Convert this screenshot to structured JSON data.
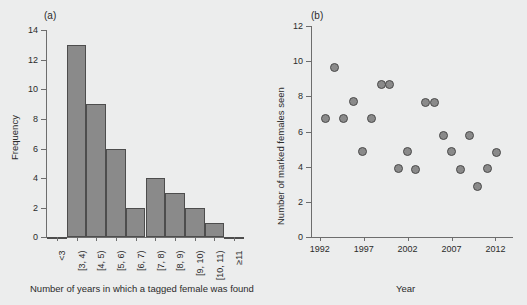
{
  "figure": {
    "background": "#eceded",
    "fill_color": "#8a8a8a",
    "stroke_color": "#4d4d4d",
    "axis_color": "#6d6d6d"
  },
  "panel_a": {
    "label": "(a)",
    "ylabel": "Frequency",
    "xlabel": "Number of years in which a tagged female was found"
  },
  "panel_b": {
    "label": "(b)",
    "ylabel": "Number of marked females seen",
    "xlabel": "Year"
  },
  "chart_data": [
    {
      "type": "bar",
      "panel": "(a)",
      "title": "",
      "xlabel": "Number of years in which a tagged female was found",
      "ylabel": "Frequency",
      "categories": [
        "<3",
        "[3, 4)",
        "[4, 5)",
        "[5, 6)",
        "[6, 7)",
        "[7, 8)",
        "[8, 9)",
        "[9, 10)",
        "[10, 11)",
        "≥11"
      ],
      "values": [
        0,
        13,
        9,
        6,
        2,
        4,
        3,
        2,
        1,
        0
      ],
      "ylim": [
        0,
        14
      ],
      "yticks": [
        0,
        2,
        4,
        6,
        8,
        10,
        12,
        14
      ],
      "grid": false,
      "legend": null
    },
    {
      "type": "scatter",
      "panel": "(b)",
      "title": "",
      "xlabel": "Year",
      "ylabel": "Number of marked females seen",
      "xlim": [
        1991,
        2014
      ],
      "ylim": [
        0,
        12
      ],
      "xticks": [
        1992,
        1997,
        2002,
        2007,
        2012
      ],
      "yticks": [
        0,
        2,
        4,
        6,
        8,
        10,
        12
      ],
      "grid": false,
      "legend": null,
      "series": [
        {
          "name": "Marked females seen",
          "points": [
            {
              "x": 1992.6,
              "y": 6.75
            },
            {
              "x": 1993.7,
              "y": 9.65
            },
            {
              "x": 1994.7,
              "y": 6.75
            },
            {
              "x": 1995.8,
              "y": 7.7
            },
            {
              "x": 1996.9,
              "y": 4.85
            },
            {
              "x": 1997.9,
              "y": 6.75
            },
            {
              "x": 1999.0,
              "y": 8.65
            },
            {
              "x": 1999.9,
              "y": 8.65
            },
            {
              "x": 2001.0,
              "y": 3.9
            },
            {
              "x": 2002.0,
              "y": 4.85
            },
            {
              "x": 2002.9,
              "y": 3.85
            },
            {
              "x": 2004.0,
              "y": 7.65
            },
            {
              "x": 2005.1,
              "y": 7.65
            },
            {
              "x": 2006.1,
              "y": 5.75
            },
            {
              "x": 2007.0,
              "y": 4.85
            },
            {
              "x": 2008.0,
              "y": 3.85
            },
            {
              "x": 2009.1,
              "y": 5.75
            },
            {
              "x": 2010.0,
              "y": 2.9
            },
            {
              "x": 2011.1,
              "y": 3.9
            },
            {
              "x": 2012.1,
              "y": 4.8
            }
          ]
        }
      ]
    }
  ]
}
